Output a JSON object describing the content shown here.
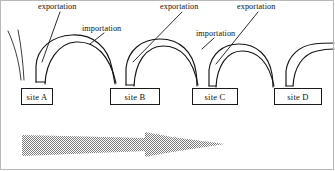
{
  "figure": {
    "background_color": "#ffffff",
    "stroke_color": "#141414",
    "arrow_color": "#9a9a9a"
  },
  "sites": [
    {
      "label": "site A",
      "x": 21,
      "y": 88,
      "w": 32,
      "h": 17
    },
    {
      "label": "site B",
      "x": 110,
      "y": 88,
      "w": 50,
      "h": 17
    },
    {
      "label": "site C",
      "x": 192,
      "y": 88,
      "w": 46,
      "h": 17
    },
    {
      "label": "site D",
      "x": 274,
      "y": 88,
      "w": 48,
      "h": 17
    }
  ],
  "labels": [
    {
      "text": "exportation",
      "x": 38,
      "y": 2
    },
    {
      "text": "importation",
      "x": 82,
      "y": 24
    },
    {
      "text": "exportation",
      "x": 160,
      "y": 2
    },
    {
      "text": "importation",
      "x": 196,
      "y": 29
    },
    {
      "text": "exportation",
      "x": 237,
      "y": 2
    }
  ],
  "arrow": {
    "name": "time-direction-arrow",
    "direction": "right",
    "style": "dithered-gray-tapered"
  }
}
